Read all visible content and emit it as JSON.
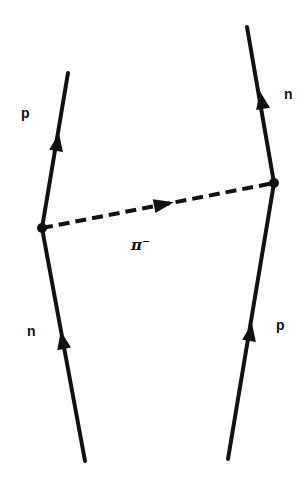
{
  "diagram": {
    "type": "feynman",
    "title": "",
    "labels": {
      "left_in": "n",
      "left_out": "p",
      "right_in": "p",
      "right_out": "n",
      "exchange": "π⁻"
    },
    "vertices": [
      {
        "id": "left",
        "x": 42,
        "y": 228
      },
      {
        "id": "right",
        "x": 274,
        "y": 183
      }
    ],
    "lines": [
      {
        "id": "left-incoming",
        "particle": "n",
        "from": [
          85,
          461
        ],
        "to": [
          42,
          228
        ],
        "style": "solid",
        "arrow": "up"
      },
      {
        "id": "left-outgoing",
        "particle": "p",
        "from": [
          42,
          228
        ],
        "to": [
          68,
          73
        ],
        "style": "solid",
        "arrow": "up"
      },
      {
        "id": "right-incoming",
        "particle": "p",
        "from": [
          228,
          459
        ],
        "to": [
          274,
          183
        ],
        "style": "solid",
        "arrow": "up"
      },
      {
        "id": "right-outgoing",
        "particle": "n",
        "from": [
          274,
          183
        ],
        "to": [
          247,
          27
        ],
        "style": "solid",
        "arrow": "up"
      },
      {
        "id": "pion-exchange",
        "particle": "π⁻",
        "from": [
          42,
          228
        ],
        "to": [
          274,
          183
        ],
        "style": "dashed",
        "arrow": "right"
      }
    ],
    "colors": {
      "line": "#111111",
      "background": "#ffffff"
    }
  }
}
